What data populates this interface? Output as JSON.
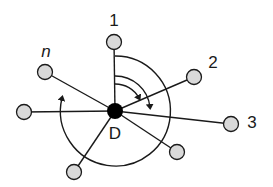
{
  "diagram": {
    "center": {
      "label": "D",
      "x": 115,
      "y": 111
    },
    "nodes": [
      {
        "id": "node-1",
        "label": "1",
        "x": 114,
        "y": 42,
        "label_x": 114,
        "label_y": 26
      },
      {
        "id": "node-2",
        "label": "2",
        "x": 194,
        "y": 77,
        "label_x": 213,
        "label_y": 68
      },
      {
        "id": "node-3",
        "label": "3",
        "x": 231,
        "y": 124,
        "label_x": 252,
        "label_y": 128
      },
      {
        "id": "node-br",
        "label": "",
        "x": 177,
        "y": 152
      },
      {
        "id": "node-bl",
        "label": "",
        "x": 74,
        "y": 172
      },
      {
        "id": "node-left",
        "label": "",
        "x": 24,
        "y": 112
      },
      {
        "id": "node-n",
        "label": "n",
        "x": 45,
        "y": 72,
        "label_x": 46,
        "label_y": 57
      }
    ],
    "colors": {
      "node_fill": "#d9d9d9",
      "stroke": "#1a1a1a",
      "center_fill": "#000000"
    }
  }
}
